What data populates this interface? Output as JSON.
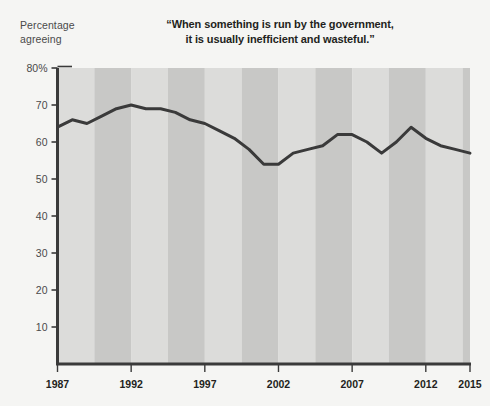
{
  "chart_data": {
    "type": "line",
    "title": "“When something is run by the government, it is usually inefficient and wasteful.”",
    "title_line1": "“When something is run by the government,",
    "title_line2": "it is usually inefficient and wasteful.”",
    "ylabel": "Percentage agreeing",
    "ylabel_line1": "Percentage",
    "ylabel_line2": "agreeing",
    "xlabel": "",
    "xlim": [
      1987,
      2015
    ],
    "ylim": [
      0,
      80
    ],
    "grid": false,
    "legend": "none",
    "band_shading": true,
    "ytick_labels": [
      "80%",
      "70",
      "60",
      "50",
      "40",
      "30",
      "20",
      "10"
    ],
    "ytick_values": [
      80,
      70,
      60,
      50,
      40,
      30,
      20,
      10
    ],
    "xtick_labels": [
      "1987",
      "1992",
      "1997",
      "2002",
      "2007",
      "2012",
      "2015"
    ],
    "xtick_values": [
      1987,
      1992,
      1997,
      2002,
      2007,
      2012,
      2015
    ],
    "x": [
      1987,
      1988,
      1989,
      1990,
      1991,
      1992,
      1993,
      1994,
      1995,
      1996,
      1997,
      1998,
      1999,
      2000,
      2001,
      2002,
      2003,
      2004,
      2005,
      2006,
      2007,
      2008,
      2009,
      2010,
      2011,
      2012,
      2013,
      2014,
      2015
    ],
    "values": [
      64,
      66,
      65,
      67,
      69,
      70,
      69,
      69,
      68,
      66,
      65,
      63,
      61,
      58,
      54,
      54,
      57,
      58,
      59,
      62,
      62,
      60,
      57,
      60,
      64,
      61,
      59,
      58,
      57
    ],
    "series": [
      {
        "name": "Percentage agreeing",
        "color": "#3a3a3a",
        "values": [
          64,
          66,
          65,
          67,
          69,
          70,
          69,
          69,
          68,
          66,
          65,
          63,
          61,
          58,
          54,
          54,
          57,
          58,
          59,
          62,
          62,
          60,
          57,
          60,
          64,
          61,
          59,
          58,
          57
        ]
      }
    ],
    "colors": {
      "line": "#3a3a3a",
      "axis": "#3a3a3a",
      "band_light": "#dcdcda",
      "band_dark": "#c8c8c6",
      "background": "#f5f5f3",
      "title_text": "#231f20",
      "tick_text": "#4a4a4a"
    }
  }
}
